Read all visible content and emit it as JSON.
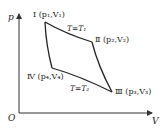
{
  "diagram": {
    "type": "p-V cycle diagram",
    "axes": {
      "y_label": "p",
      "x_label": "V",
      "origin_label": "O"
    },
    "states": [
      {
        "id": "I",
        "label": "Ⅰ (p₁,V₁)"
      },
      {
        "id": "II",
        "label": "Ⅱ (p₂,V₂)"
      },
      {
        "id": "III",
        "label": "Ⅲ (p₃,V₃)"
      },
      {
        "id": "IV",
        "label": "Ⅳ (p₄,V₄)"
      }
    ],
    "processes": [
      {
        "from": "I",
        "to": "II",
        "label": "T=T₁"
      },
      {
        "from": "II",
        "to": "III",
        "label": ""
      },
      {
        "from": "III",
        "to": "IV",
        "label": "T=T₂"
      },
      {
        "from": "IV",
        "to": "I",
        "label": ""
      }
    ],
    "line_color": "#222222"
  }
}
